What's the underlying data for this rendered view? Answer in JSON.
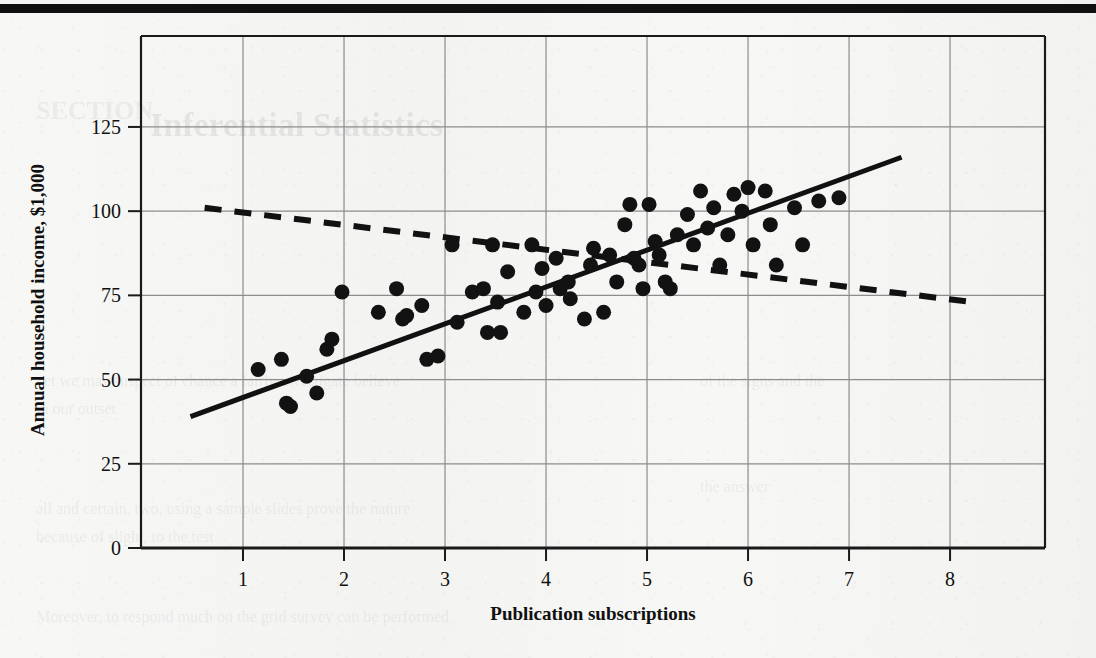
{
  "page": {
    "background_color": "#f6f6f4",
    "top_rule_color": "#111111",
    "ghost_text": [
      {
        "text": "SECTION",
        "x": 36,
        "y": 96,
        "size": 26
      },
      {
        "text": "Inferential Statistics",
        "x": 150,
        "y": 106,
        "size": 34
      },
      {
        "text": "yet we may suspect of chance a fairly investigate believe",
        "x": 36,
        "y": 372,
        "size": 16
      },
      {
        "text": "in our outset",
        "x": 36,
        "y": 400,
        "size": 16
      },
      {
        "text": "all and certain, two, using a sample slides prove the nature",
        "x": 36,
        "y": 500,
        "size": 16
      },
      {
        "text": "because of slight, to the test",
        "x": 36,
        "y": 528,
        "size": 16
      },
      {
        "text": "Moreover, to respond much on the grid survey can be performed",
        "x": 36,
        "y": 608,
        "size": 16
      },
      {
        "text": "of the signs  and the",
        "x": 700,
        "y": 372,
        "size": 16
      },
      {
        "text": "the answer",
        "x": 700,
        "y": 478,
        "size": 16
      }
    ]
  },
  "chart_data": {
    "type": "scatter",
    "title": "",
    "xlabel": "Publication subscriptions",
    "ylabel": "Annual household income, $1,000",
    "xlim": [
      -0.01,
      8.94
    ],
    "ylim": [
      0,
      152
    ],
    "xticks": [
      1,
      2,
      3,
      4,
      5,
      6,
      7,
      8
    ],
    "yticks": [
      0,
      25,
      50,
      75,
      100,
      125
    ],
    "grid": true,
    "grid_color": "#8c8c8c",
    "frame_color": "#1a1a1a",
    "marker": {
      "shape": "circle",
      "color": "#121212",
      "size": 15
    },
    "points": [
      {
        "x": 1.15,
        "y": 53
      },
      {
        "x": 1.38,
        "y": 56
      },
      {
        "x": 1.43,
        "y": 43
      },
      {
        "x": 1.47,
        "y": 42
      },
      {
        "x": 1.63,
        "y": 51
      },
      {
        "x": 1.73,
        "y": 46
      },
      {
        "x": 1.83,
        "y": 59
      },
      {
        "x": 1.88,
        "y": 62
      },
      {
        "x": 1.98,
        "y": 76
      },
      {
        "x": 2.34,
        "y": 70
      },
      {
        "x": 2.52,
        "y": 77
      },
      {
        "x": 2.58,
        "y": 68
      },
      {
        "x": 2.62,
        "y": 69
      },
      {
        "x": 2.77,
        "y": 72
      },
      {
        "x": 2.82,
        "y": 56
      },
      {
        "x": 2.93,
        "y": 57
      },
      {
        "x": 3.07,
        "y": 90
      },
      {
        "x": 3.12,
        "y": 67
      },
      {
        "x": 3.27,
        "y": 76
      },
      {
        "x": 3.38,
        "y": 77
      },
      {
        "x": 3.42,
        "y": 64
      },
      {
        "x": 3.47,
        "y": 90
      },
      {
        "x": 3.52,
        "y": 73
      },
      {
        "x": 3.55,
        "y": 64
      },
      {
        "x": 3.62,
        "y": 82
      },
      {
        "x": 3.78,
        "y": 70
      },
      {
        "x": 3.86,
        "y": 90
      },
      {
        "x": 3.9,
        "y": 76
      },
      {
        "x": 3.96,
        "y": 83
      },
      {
        "x": 4.0,
        "y": 72
      },
      {
        "x": 4.1,
        "y": 86
      },
      {
        "x": 4.14,
        "y": 77
      },
      {
        "x": 4.22,
        "y": 79
      },
      {
        "x": 4.24,
        "y": 74
      },
      {
        "x": 4.38,
        "y": 68
      },
      {
        "x": 4.44,
        "y": 84
      },
      {
        "x": 4.47,
        "y": 89
      },
      {
        "x": 4.57,
        "y": 70
      },
      {
        "x": 4.63,
        "y": 87
      },
      {
        "x": 4.7,
        "y": 79
      },
      {
        "x": 4.78,
        "y": 96
      },
      {
        "x": 4.83,
        "y": 102
      },
      {
        "x": 4.87,
        "y": 86
      },
      {
        "x": 4.92,
        "y": 84
      },
      {
        "x": 4.96,
        "y": 77
      },
      {
        "x": 5.02,
        "y": 102
      },
      {
        "x": 5.08,
        "y": 91
      },
      {
        "x": 5.12,
        "y": 87
      },
      {
        "x": 5.18,
        "y": 79
      },
      {
        "x": 5.23,
        "y": 77
      },
      {
        "x": 5.3,
        "y": 93
      },
      {
        "x": 5.4,
        "y": 99
      },
      {
        "x": 5.46,
        "y": 90
      },
      {
        "x": 5.53,
        "y": 106
      },
      {
        "x": 5.6,
        "y": 95
      },
      {
        "x": 5.66,
        "y": 101
      },
      {
        "x": 5.72,
        "y": 84
      },
      {
        "x": 5.8,
        "y": 93
      },
      {
        "x": 5.86,
        "y": 105
      },
      {
        "x": 5.94,
        "y": 100
      },
      {
        "x": 6.0,
        "y": 107
      },
      {
        "x": 6.05,
        "y": 90
      },
      {
        "x": 6.17,
        "y": 106
      },
      {
        "x": 6.22,
        "y": 96
      },
      {
        "x": 6.28,
        "y": 84
      },
      {
        "x": 6.46,
        "y": 101
      },
      {
        "x": 6.54,
        "y": 90
      },
      {
        "x": 6.7,
        "y": 103
      },
      {
        "x": 6.9,
        "y": 104
      }
    ],
    "lines": [
      {
        "name": "solid-regression-line",
        "style": "solid",
        "color": "#111111",
        "width": 5,
        "x0": 0.48,
        "y0": 39,
        "x1": 7.52,
        "y1": 116
      },
      {
        "name": "dashed-regression-line",
        "style": "dashed",
        "color": "#111111",
        "width": 6,
        "dash": "17,13",
        "x0": 0.62,
        "y0": 101,
        "x1": 8.22,
        "y1": 73
      }
    ]
  }
}
